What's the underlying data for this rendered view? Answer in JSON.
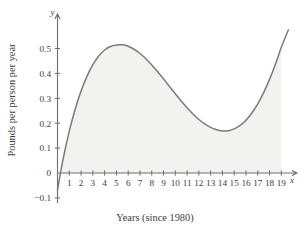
{
  "chart_data": {
    "type": "line",
    "title": "",
    "subtitle": "",
    "xlabel": "Years (since 1980)",
    "ylabel": "Pounds per person per year",
    "x_axis_letter": "x",
    "y_axis_letter": "y",
    "xlim": [
      0,
      19.8
    ],
    "ylim": [
      -0.12,
      0.58
    ],
    "grid": false,
    "legend": null,
    "legend_position": "none",
    "fill_under_curve": true,
    "fill_baseline": 0,
    "fill_x_range": [
      0.25,
      19
    ],
    "xticks": [
      1,
      2,
      3,
      4,
      5,
      6,
      7,
      8,
      9,
      10,
      11,
      12,
      13,
      14,
      15,
      16,
      17,
      18,
      19
    ],
    "xtick_labels": [
      "1",
      "2",
      "3",
      "4",
      "5",
      "6",
      "7",
      "8",
      "9",
      "10",
      "11",
      "12",
      "13",
      "14",
      "15",
      "16",
      "17",
      "18",
      "19"
    ],
    "yticks": [
      -0.1,
      0,
      0.1,
      0.2,
      0.3,
      0.4,
      0.5
    ],
    "ytick_labels": [
      "−0.1",
      "0",
      "0.1",
      "0.2",
      "0.3",
      "0.4",
      "0.5"
    ],
    "annotations": [],
    "features": {
      "y_intercept": -0.07,
      "zero_crossing_x": 0.25,
      "local_max": {
        "x": 5.6,
        "y": 0.515
      },
      "local_min": {
        "x": 14.5,
        "y": 0.17
      },
      "right_end": {
        "x": 19.6,
        "y": 0.575
      }
    },
    "series": [
      {
        "name": "consumption rate",
        "color": "#7a7a7a",
        "x": [
          0.0,
          0.25,
          0.5,
          1.0,
          1.5,
          2.0,
          2.5,
          3.0,
          3.5,
          4.0,
          4.5,
          5.0,
          5.5,
          5.6,
          6.0,
          6.5,
          7.0,
          7.5,
          8.0,
          8.5,
          9.0,
          9.5,
          10.0,
          10.5,
          11.0,
          11.5,
          12.0,
          12.5,
          13.0,
          13.5,
          14.0,
          14.5,
          15.0,
          15.5,
          16.0,
          16.5,
          17.0,
          17.5,
          18.0,
          18.5,
          19.0,
          19.6
        ],
        "y": [
          -0.07,
          0.0,
          0.062,
          0.168,
          0.256,
          0.329,
          0.388,
          0.435,
          0.47,
          0.494,
          0.508,
          0.514,
          0.515,
          0.515,
          0.509,
          0.497,
          0.48,
          0.459,
          0.434,
          0.407,
          0.378,
          0.348,
          0.318,
          0.289,
          0.262,
          0.237,
          0.215,
          0.197,
          0.183,
          0.174,
          0.169,
          0.17,
          0.177,
          0.191,
          0.212,
          0.241,
          0.278,
          0.323,
          0.376,
          0.437,
          0.505,
          0.575
        ]
      }
    ]
  },
  "colors": {
    "curve": "#7a7a7a",
    "fill": "#f2f2f0",
    "axis": "#6e6e6e",
    "text": "#3d3d3d",
    "background": "#ffffff"
  }
}
